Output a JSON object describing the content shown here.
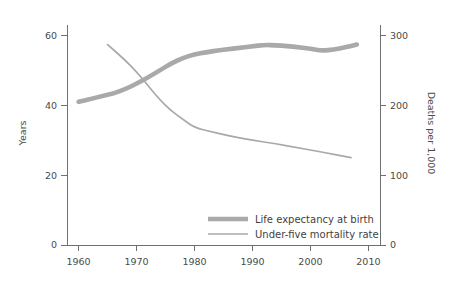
{
  "chart_data": {
    "type": "line",
    "title": "",
    "xlabel": "",
    "ylabel": "Years",
    "y2label": "Deaths per 1,000",
    "xlim": [
      1958,
      2012
    ],
    "ylim": [
      0,
      63
    ],
    "y2lim": [
      0,
      315
    ],
    "grid": false,
    "legend_position": "inside-bottom-center",
    "x_ticks": [
      "1960",
      "1970",
      "1980",
      "1990",
      "2000",
      "2010"
    ],
    "x_tick_values": [
      1960,
      1970,
      1980,
      1990,
      2000,
      2010
    ],
    "y_ticks": [
      "0",
      "20",
      "40",
      "60"
    ],
    "y_tick_values": [
      0,
      20,
      40,
      60
    ],
    "y2_ticks": [
      "0",
      "100",
      "200",
      "300"
    ],
    "y2_tick_values": [
      0,
      100,
      200,
      300
    ],
    "series": [
      {
        "name": "Life expectancy at birth",
        "axis": "left",
        "units": "Years",
        "color": "#a9a9a9",
        "line_width": "thick",
        "x": [
          1960,
          1962,
          1964,
          1966,
          1968,
          1970,
          1972,
          1974,
          1976,
          1978,
          1980,
          1982,
          1984,
          1986,
          1988,
          1990,
          1992,
          1994,
          1996,
          1998,
          2000,
          2002,
          2004,
          2006,
          2008
        ],
        "values": [
          41.0,
          41.8,
          42.6,
          43.4,
          44.6,
          46.2,
          48.0,
          50.0,
          52.0,
          53.6,
          54.6,
          55.2,
          55.7,
          56.1,
          56.5,
          56.9,
          57.3,
          57.2,
          57.0,
          56.6,
          56.2,
          55.6,
          56.0,
          56.6,
          57.4
        ]
      },
      {
        "name": "Under-five mortality rate",
        "axis": "right",
        "units": "Deaths per 1,000",
        "color": "#a9a9a9",
        "line_width": "thin",
        "x": [
          1965,
          1968,
          1970,
          1972,
          1974,
          1976,
          1978,
          1980,
          1983,
          1986,
          1990,
          1994,
          1998,
          2002,
          2007
        ],
        "values": [
          287,
          265,
          248,
          228,
          208,
          192,
          180,
          168,
          162,
          156,
          150,
          145,
          139,
          133,
          125
        ]
      }
    ]
  },
  "legend": {
    "items": [
      {
        "label": "Life expectancy at birth",
        "style": "thick"
      },
      {
        "label": "Under-five mortality rate",
        "style": "thin"
      }
    ]
  },
  "axes": {
    "left_title": "Years",
    "right_title": "Deaths per 1,000"
  }
}
